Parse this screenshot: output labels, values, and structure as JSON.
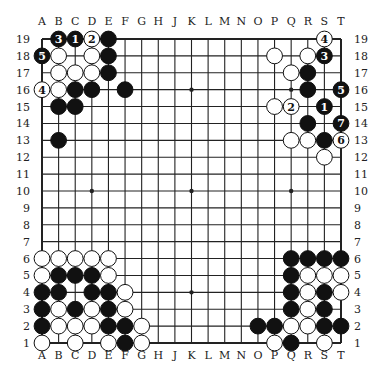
{
  "diagram": {
    "type": "go-board",
    "size": 19,
    "columns": [
      "A",
      "B",
      "C",
      "D",
      "E",
      "F",
      "G",
      "H",
      "J",
      "K",
      "L",
      "M",
      "N",
      "O",
      "P",
      "Q",
      "R",
      "S",
      "T"
    ],
    "rows": [
      19,
      18,
      17,
      16,
      15,
      14,
      13,
      12,
      11,
      10,
      9,
      8,
      7,
      6,
      5,
      4,
      3,
      2,
      1
    ],
    "star_points": [
      "D16",
      "K16",
      "Q16",
      "D10",
      "K10",
      "Q10",
      "D4",
      "K4",
      "Q4"
    ],
    "colors": {
      "black": "#111111",
      "white": "#ffffff",
      "line": "#222222",
      "label": "#222222"
    },
    "stones": [
      {
        "pos": "B19",
        "color": "black",
        "label": "3"
      },
      {
        "pos": "C19",
        "color": "black",
        "label": "1"
      },
      {
        "pos": "D19",
        "color": "white",
        "label": "2"
      },
      {
        "pos": "E19",
        "color": "black",
        "label": ""
      },
      {
        "pos": "A18",
        "color": "black",
        "label": "5"
      },
      {
        "pos": "B18",
        "color": "white",
        "label": ""
      },
      {
        "pos": "D18",
        "color": "white",
        "label": ""
      },
      {
        "pos": "E18",
        "color": "black",
        "label": ""
      },
      {
        "pos": "B17",
        "color": "white",
        "label": ""
      },
      {
        "pos": "C17",
        "color": "white",
        "label": ""
      },
      {
        "pos": "D17",
        "color": "white",
        "label": ""
      },
      {
        "pos": "E17",
        "color": "black",
        "label": ""
      },
      {
        "pos": "A16",
        "color": "white",
        "label": "4"
      },
      {
        "pos": "B16",
        "color": "white",
        "label": ""
      },
      {
        "pos": "C16",
        "color": "black",
        "label": ""
      },
      {
        "pos": "D16",
        "color": "black",
        "label": ""
      },
      {
        "pos": "F16",
        "color": "black",
        "label": ""
      },
      {
        "pos": "B15",
        "color": "black",
        "label": ""
      },
      {
        "pos": "C15",
        "color": "black",
        "label": ""
      },
      {
        "pos": "B13",
        "color": "black",
        "label": ""
      },
      {
        "pos": "S19",
        "color": "white",
        "label": "4"
      },
      {
        "pos": "P18",
        "color": "white",
        "label": ""
      },
      {
        "pos": "R18",
        "color": "white",
        "label": ""
      },
      {
        "pos": "S18",
        "color": "black",
        "label": "3"
      },
      {
        "pos": "Q17",
        "color": "white",
        "label": ""
      },
      {
        "pos": "R17",
        "color": "black",
        "label": ""
      },
      {
        "pos": "R16",
        "color": "black",
        "label": ""
      },
      {
        "pos": "T16",
        "color": "black",
        "label": "5"
      },
      {
        "pos": "P15",
        "color": "white",
        "label": ""
      },
      {
        "pos": "Q15",
        "color": "white",
        "label": "2"
      },
      {
        "pos": "S15",
        "color": "black",
        "label": "1"
      },
      {
        "pos": "R14",
        "color": "black",
        "label": ""
      },
      {
        "pos": "T14",
        "color": "black",
        "label": "7"
      },
      {
        "pos": "Q13",
        "color": "white",
        "label": ""
      },
      {
        "pos": "R13",
        "color": "white",
        "label": ""
      },
      {
        "pos": "S13",
        "color": "black",
        "label": ""
      },
      {
        "pos": "T13",
        "color": "white",
        "label": "6"
      },
      {
        "pos": "S12",
        "color": "white",
        "label": ""
      },
      {
        "pos": "A6",
        "color": "white",
        "label": ""
      },
      {
        "pos": "B6",
        "color": "white",
        "label": ""
      },
      {
        "pos": "C6",
        "color": "white",
        "label": ""
      },
      {
        "pos": "D6",
        "color": "white",
        "label": ""
      },
      {
        "pos": "E6",
        "color": "white",
        "label": ""
      },
      {
        "pos": "A5",
        "color": "white",
        "label": ""
      },
      {
        "pos": "B5",
        "color": "black",
        "label": ""
      },
      {
        "pos": "C5",
        "color": "black",
        "label": ""
      },
      {
        "pos": "D5",
        "color": "black",
        "label": ""
      },
      {
        "pos": "E5",
        "color": "white",
        "label": ""
      },
      {
        "pos": "A4",
        "color": "black",
        "label": ""
      },
      {
        "pos": "B4",
        "color": "black",
        "label": ""
      },
      {
        "pos": "D4",
        "color": "black",
        "label": ""
      },
      {
        "pos": "E4",
        "color": "black",
        "label": ""
      },
      {
        "pos": "F4",
        "color": "white",
        "label": ""
      },
      {
        "pos": "A3",
        "color": "black",
        "label": ""
      },
      {
        "pos": "B3",
        "color": "white",
        "label": ""
      },
      {
        "pos": "C3",
        "color": "black",
        "label": ""
      },
      {
        "pos": "D3",
        "color": "white",
        "label": ""
      },
      {
        "pos": "E3",
        "color": "black",
        "label": ""
      },
      {
        "pos": "F3",
        "color": "white",
        "label": ""
      },
      {
        "pos": "A2",
        "color": "black",
        "label": ""
      },
      {
        "pos": "B2",
        "color": "white",
        "label": ""
      },
      {
        "pos": "C2",
        "color": "white",
        "label": ""
      },
      {
        "pos": "D2",
        "color": "white",
        "label": ""
      },
      {
        "pos": "E2",
        "color": "black",
        "label": ""
      },
      {
        "pos": "F2",
        "color": "black",
        "label": ""
      },
      {
        "pos": "G2",
        "color": "white",
        "label": ""
      },
      {
        "pos": "A1",
        "color": "white",
        "label": ""
      },
      {
        "pos": "C1",
        "color": "white",
        "label": ""
      },
      {
        "pos": "E1",
        "color": "white",
        "label": ""
      },
      {
        "pos": "F1",
        "color": "black",
        "label": ""
      },
      {
        "pos": "G1",
        "color": "white",
        "label": ""
      },
      {
        "pos": "Q6",
        "color": "black",
        "label": ""
      },
      {
        "pos": "R6",
        "color": "black",
        "label": ""
      },
      {
        "pos": "S6",
        "color": "black",
        "label": ""
      },
      {
        "pos": "T6",
        "color": "black",
        "label": ""
      },
      {
        "pos": "Q5",
        "color": "black",
        "label": ""
      },
      {
        "pos": "R5",
        "color": "white",
        "label": ""
      },
      {
        "pos": "S5",
        "color": "white",
        "label": ""
      },
      {
        "pos": "T5",
        "color": "white",
        "label": ""
      },
      {
        "pos": "Q4",
        "color": "black",
        "label": ""
      },
      {
        "pos": "R4",
        "color": "white",
        "label": ""
      },
      {
        "pos": "S4",
        "color": "black",
        "label": ""
      },
      {
        "pos": "T4",
        "color": "white",
        "label": ""
      },
      {
        "pos": "Q3",
        "color": "black",
        "label": ""
      },
      {
        "pos": "R3",
        "color": "white",
        "label": ""
      },
      {
        "pos": "S3",
        "color": "black",
        "label": ""
      },
      {
        "pos": "O2",
        "color": "black",
        "label": ""
      },
      {
        "pos": "P2",
        "color": "black",
        "label": ""
      },
      {
        "pos": "Q2",
        "color": "white",
        "label": ""
      },
      {
        "pos": "R2",
        "color": "white",
        "label": ""
      },
      {
        "pos": "S2",
        "color": "black",
        "label": ""
      },
      {
        "pos": "T2",
        "color": "black",
        "label": ""
      },
      {
        "pos": "P1",
        "color": "white",
        "label": ""
      },
      {
        "pos": "Q1",
        "color": "black",
        "label": ""
      },
      {
        "pos": "S1",
        "color": "white",
        "label": ""
      }
    ]
  }
}
